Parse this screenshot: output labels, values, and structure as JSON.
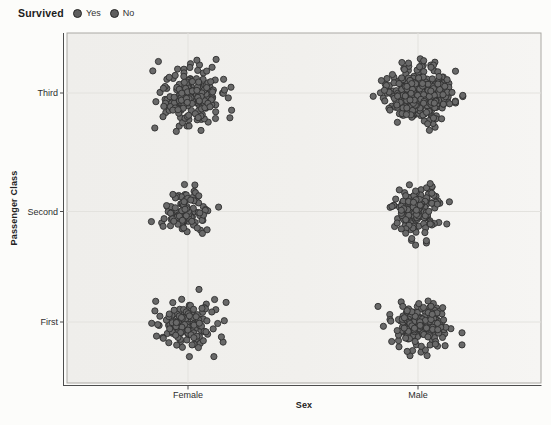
{
  "legend": {
    "title": "Survived",
    "entries": [
      {
        "label": "Yes",
        "dot_color": "#5e5e5e"
      },
      {
        "label": "No",
        "dot_color": "#5e5e5e"
      }
    ]
  },
  "chart_data": {
    "type": "scatter",
    "variant": "jittered-categorical",
    "title": "",
    "xlabel": "Sex",
    "ylabel": "Passenger Class",
    "x_categories": [
      "Female",
      "Male"
    ],
    "y_categories": [
      "Third",
      "Second",
      "First"
    ],
    "legend": {
      "title": "Survived",
      "entries": [
        "Yes",
        "No"
      ]
    },
    "grid": true,
    "point_color": "#696969",
    "point_stroke": "#2f2f2f",
    "groups": [
      {
        "passenger_class": "Third",
        "sex": "Female",
        "count": 200,
        "spread_x": 17,
        "spread_y": 13,
        "offset_x": 4,
        "offset_y": 2
      },
      {
        "passenger_class": "Third",
        "sex": "Male",
        "count": 380,
        "spread_x": 16,
        "spread_y": 13,
        "offset_x": 0,
        "offset_y": 2
      },
      {
        "passenger_class": "Second",
        "sex": "Female",
        "count": 100,
        "spread_x": 12,
        "spread_y": 12,
        "offset_x": -3,
        "offset_y": 0
      },
      {
        "passenger_class": "Second",
        "sex": "Male",
        "count": 150,
        "spread_x": 12,
        "spread_y": 12,
        "offset_x": -2,
        "offset_y": 0
      },
      {
        "passenger_class": "First",
        "sex": "Female",
        "count": 140,
        "spread_x": 15,
        "spread_y": 12,
        "offset_x": -1,
        "offset_y": 1
      },
      {
        "passenger_class": "First",
        "sex": "Male",
        "count": 170,
        "spread_x": 15,
        "spread_y": 11,
        "offset_x": 2,
        "offset_y": 5
      }
    ]
  }
}
